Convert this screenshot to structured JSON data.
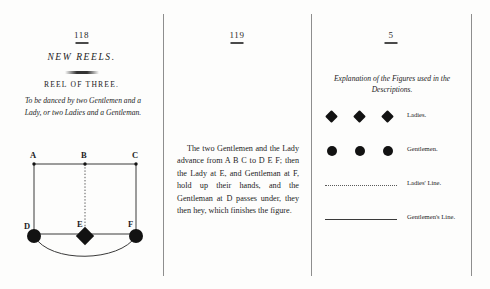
{
  "document": {
    "title": "New Reels — Reel of Three"
  },
  "left_panel": {
    "folio": "118",
    "heading": "NEW REELS.",
    "subheading": "REEL OF THREE.",
    "description": "To be danced by two Gentlemen and a Lady, or two Ladies and a Gentleman.",
    "diagram": {
      "top_labels": [
        "A",
        "B",
        "C"
      ],
      "bottom_labels": [
        "D",
        "E",
        "F"
      ],
      "nodes": [
        {
          "label": "D",
          "shape": "circle",
          "role": "Gentleman"
        },
        {
          "label": "E",
          "shape": "diamond",
          "role": "Lady"
        },
        {
          "label": "F",
          "shape": "circle",
          "role": "Gentleman"
        }
      ],
      "lines": [
        {
          "from": "A",
          "to": "D",
          "style": "solid"
        },
        {
          "from": "B",
          "to": "E",
          "style": "dotted"
        },
        {
          "from": "C",
          "to": "F",
          "style": "solid"
        },
        {
          "from": "A",
          "to": "C",
          "style": "solid"
        },
        {
          "from": "D",
          "to": "F",
          "style": "solid"
        },
        {
          "from": "D",
          "to": "F",
          "style": "arc"
        }
      ]
    }
  },
  "middle_panel": {
    "folio": "119",
    "paragraph": "The two Gentlemen and the Lady advance from A B C to D E F; then the Lady at E, and Gentleman at F, hold up their hands, and the Gentleman at D passes under, they then hey, which finishes the figure."
  },
  "right_panel": {
    "folio": "5",
    "legend_title": "Explanation of the Figures used in the Descriptions.",
    "legend": [
      {
        "symbol": "diamond",
        "count": 3,
        "label": "Ladies."
      },
      {
        "symbol": "circle",
        "count": 3,
        "label": "Gentlemen."
      },
      {
        "symbol": "dotted-line",
        "label": "Ladies' Line."
      },
      {
        "symbol": "solid-line",
        "label": "Gentlemen's Line."
      }
    ]
  },
  "colors": {
    "ink": "#1a1a1a",
    "rule": "#8e8e8e",
    "paper": "#fdfdfc"
  }
}
